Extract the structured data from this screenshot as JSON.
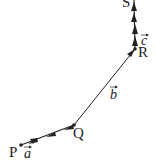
{
  "diagram": {
    "type": "vector-path",
    "colors": {
      "stroke": "#222222",
      "background": "#ffffff"
    },
    "points": [
      {
        "id": "P",
        "label": "P",
        "x": 21,
        "y": 145
      },
      {
        "id": "Q",
        "label": "Q",
        "x": 74,
        "y": 125
      },
      {
        "id": "R",
        "label": "R",
        "x": 135,
        "y": 49
      },
      {
        "id": "S",
        "label": "S",
        "x": 134,
        "y": 0
      }
    ],
    "vectors": [
      {
        "id": "a",
        "label": "a",
        "from": "P",
        "to": "Q",
        "arrowheads": 3
      },
      {
        "id": "b",
        "label": "b",
        "from": "Q",
        "to": "R",
        "arrowheads": 1
      },
      {
        "id": "c",
        "label": "c",
        "from": "R",
        "to": "S",
        "arrowheads": 4
      }
    ]
  }
}
